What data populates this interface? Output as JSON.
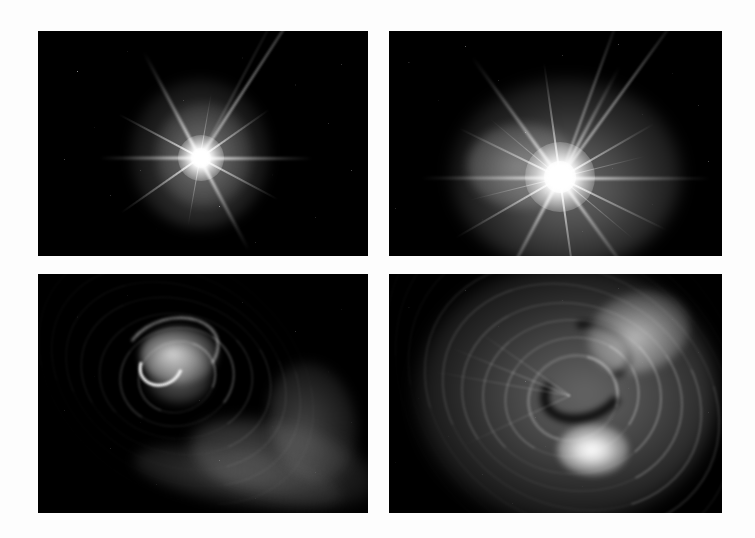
{
  "figure": {
    "background_color": "#fdfdfd",
    "panel_background_color": "#000000",
    "width": 755,
    "height": 538,
    "layout": "2x2 grid",
    "colormap": "grayscale"
  },
  "panels": [
    {
      "id": "panel-top-left",
      "position": "top-left",
      "row": 1,
      "column": 1,
      "x": 38,
      "y": 31,
      "width": 330,
      "height": 225,
      "subject": "Bright point source with eight-point diffraction spikes and faint diffuse ejecta halo",
      "feature_type": "stellar-burst",
      "brightness": "moderate",
      "core_center_x": 200,
      "core_center_y": 157,
      "spike_count": 8,
      "halo_description": "soft oval nebular glow offset above and left of core",
      "extra_feature": "long linear streak entering from upper-right corner",
      "starfield_density": "sparse"
    },
    {
      "id": "panel-top-right",
      "position": "top-right",
      "row": 1,
      "column": 2,
      "x": 389,
      "y": 31,
      "width": 333,
      "height": 225,
      "subject": "Brighter, larger point source with numerous diffraction spikes and extended luminous halo",
      "feature_type": "stellar-burst",
      "brightness": "high",
      "core_center_x": 560,
      "core_center_y": 177,
      "spike_count": 12,
      "halo_description": "broad saturated glow with mottled cloud texture to the left of core",
      "extra_feature": "long linear streak entering from upper-right corner",
      "starfield_density": "dense"
    },
    {
      "id": "panel-bottom-left",
      "position": "bottom-left",
      "row": 2,
      "column": 1,
      "x": 38,
      "y": 274,
      "width": 330,
      "height": 239,
      "subject": "Motion-blurred spiral vortex with concentric arcs and bright curved filaments",
      "feature_type": "spiral-vortex",
      "brightness": "moderate",
      "core_center_x": 175,
      "core_center_y": 375,
      "arc_count": 7,
      "halo_description": "wispy trailing plume sweeping toward lower-right",
      "extra_feature": "bright hook-shaped filament near upper-left of vortex core",
      "starfield_density": "sparse"
    },
    {
      "id": "panel-bottom-right",
      "position": "bottom-right",
      "row": 2,
      "column": 2,
      "x": 389,
      "y": 274,
      "width": 333,
      "height": 239,
      "subject": "Zoomed view of spiral vortex filling frame with concentric rings and bright inner knot",
      "feature_type": "spiral-vortex",
      "brightness": "high",
      "core_center_x": 570,
      "core_center_y": 395,
      "arc_count": 9,
      "halo_description": "nested concentric spiral rings spanning the full panel",
      "extra_feature": "saturated white knot below the dark S-shaped lane at center",
      "starfield_density": "dense"
    }
  ],
  "chart_data": {
    "type": "heatmap",
    "xlabel": "",
    "ylabel": "",
    "grid": false,
    "legend": "none",
    "panel_labels": [
      "top-left",
      "top-right",
      "bottom-left",
      "bottom-right"
    ],
    "relative_peak_intensity": [
      0.78,
      1.0,
      0.55,
      0.82
    ],
    "colormap": "grayscale",
    "value_range": [
      0,
      1
    ]
  }
}
